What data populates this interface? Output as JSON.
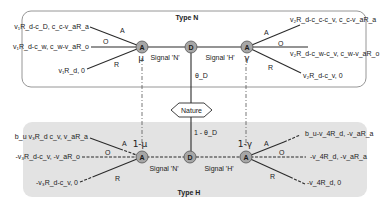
{
  "diagram": {
    "type_n": {
      "title": "Type N",
      "left_node": {
        "label": "A",
        "prob": "μ"
      },
      "center_node": {
        "label": "D"
      },
      "right_node": {
        "label": "A",
        "prob": "γ"
      },
      "signal_left": "Signal 'N'",
      "signal_right": "Signal 'H'",
      "left_branches": [
        {
          "action": "A",
          "payoff": "v₁R_d-c_D, c_c-v_aR_a"
        },
        {
          "action": "O",
          "payoff": "v₁R_d-c_w, c_w-v_aR_o"
        },
        {
          "action": "R",
          "payoff": "v₁R_d, 0"
        }
      ],
      "right_branches": [
        {
          "action": "A",
          "payoff": "v₂R_d-c_c-c_v, c_c-v_aR_a"
        },
        {
          "action": "O",
          "payoff": "v₂R_d-c_w-c_v, c_w-v_aR_o"
        },
        {
          "action": "R",
          "payoff": "v₂R_d-c_v, 0"
        }
      ]
    },
    "nature": {
      "label": "Nature",
      "prob_up": "θ_D",
      "prob_down": "1 - θ_D"
    },
    "type_h": {
      "title": "Type H",
      "left_node": {
        "label": "A",
        "prob": "1-μ"
      },
      "center_node": {
        "label": "D"
      },
      "right_node": {
        "label": "A",
        "prob": "1-γ"
      },
      "signal_left": "Signal 'N'",
      "signal_right": "Signal 'H'",
      "left_branches": [
        {
          "action": "A",
          "payoff": "b_u v₃R_d c_v, v_aR_a"
        },
        {
          "action": "O",
          "payoff": "-v₃R_d-c_v, -v_aR_o"
        },
        {
          "action": "R",
          "payoff": "-v₃R_d-c_v, 0"
        }
      ],
      "right_branches": [
        {
          "action": "A",
          "payoff": "b_u-v_4R_d, -v_aR_a"
        },
        {
          "action": "O",
          "payoff": "-v_4R_d, -v_aR_a"
        },
        {
          "action": "R",
          "payoff": "-v_4R_d, 0"
        }
      ]
    },
    "colors": {
      "node_fill": "#a6a6a6",
      "node_stroke": "#555555",
      "type_h_bg": "#e3e3e3",
      "type_n_border": "#8a8a8a",
      "line": "#2b2b2b"
    }
  }
}
